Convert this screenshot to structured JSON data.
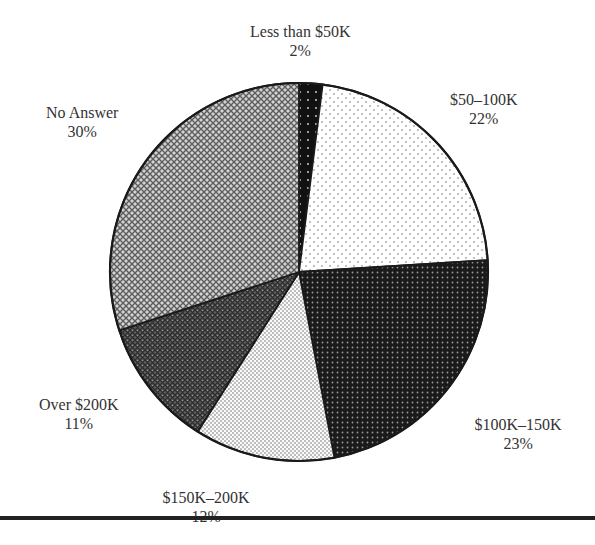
{
  "chart_data": {
    "type": "pie",
    "title": "",
    "start_angle_deg": -90,
    "direction": "clockwise",
    "center": [
      299,
      272
    ],
    "radius": 189,
    "slices": [
      {
        "label": "Less than $50K",
        "value": 2,
        "display": "2%",
        "pattern": "black-dots",
        "label_pos": [
          300,
          22
        ]
      },
      {
        "label": "$50–100K",
        "value": 22,
        "display": "22%",
        "pattern": "sparse-dots",
        "label_pos": [
          484,
          90
        ]
      },
      {
        "label": "$100K–150K",
        "value": 23,
        "display": "23%",
        "pattern": "dark-dots",
        "label_pos": [
          518,
          415
        ]
      },
      {
        "label": "$150K–200K",
        "value": 12,
        "display": "12%",
        "pattern": "fine-dots",
        "label_pos": [
          206,
          488
        ]
      },
      {
        "label": "Over $200K",
        "value": 11,
        "display": "11%",
        "pattern": "dark-crosshatch",
        "label_pos": [
          79,
          395
        ]
      },
      {
        "label": "No Answer",
        "value": 30,
        "display": "30%",
        "pattern": "light-crosshatch",
        "label_pos": [
          82,
          103
        ]
      }
    ],
    "categories": [
      "Less than $50K",
      "$50–100K",
      "$100K–150K",
      "$150K–200K",
      "Over $200K",
      "No Answer"
    ],
    "values": [
      2,
      22,
      23,
      12,
      11,
      30
    ],
    "legend": "none (inline labels)"
  }
}
